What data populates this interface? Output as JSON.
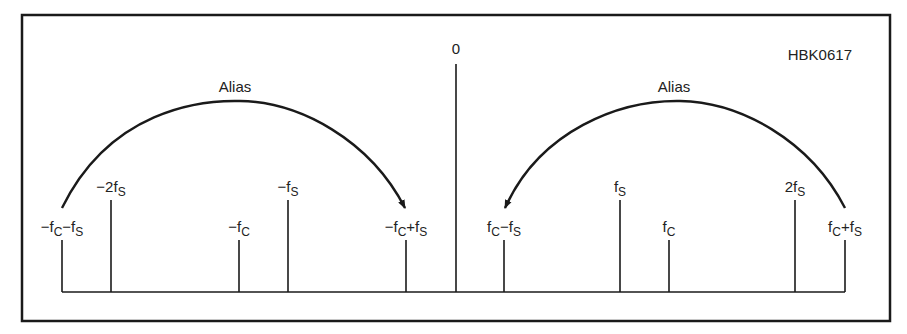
{
  "figure": {
    "id_label": "HBK0617",
    "zero_label": "0",
    "alias_left_label": "Alias",
    "alias_right_label": "Alias",
    "colors": {
      "ink": "#1a1a1a",
      "background": "#ffffff"
    }
  },
  "spectral_lines": [
    {
      "key": "neg_fc_minus_fs",
      "x": 62,
      "top": 240,
      "label_parts": [
        "−f",
        "C",
        "−f",
        "S"
      ]
    },
    {
      "key": "neg_2fs",
      "x": 111,
      "top": 200,
      "label_parts": [
        "−2f",
        "S"
      ]
    },
    {
      "key": "neg_fc",
      "x": 239,
      "top": 240,
      "label_parts": [
        "−f",
        "C"
      ]
    },
    {
      "key": "neg_fs",
      "x": 288,
      "top": 200,
      "label_parts": [
        "−f",
        "S"
      ]
    },
    {
      "key": "neg_fc_plus_fs",
      "x": 406,
      "top": 240,
      "label_parts": [
        "−f",
        "C",
        "+f",
        "S"
      ]
    },
    {
      "key": "zero",
      "x": 456,
      "top": 64,
      "label_parts": [
        "0"
      ]
    },
    {
      "key": "fc_minus_fs",
      "x": 504,
      "top": 240,
      "label_parts": [
        "f",
        "C",
        "−f",
        "S"
      ]
    },
    {
      "key": "fs",
      "x": 620,
      "top": 200,
      "label_parts": [
        "f",
        "S"
      ]
    },
    {
      "key": "fc",
      "x": 669,
      "top": 240,
      "label_parts": [
        "f",
        "C"
      ]
    },
    {
      "key": "2fs",
      "x": 795,
      "top": 200,
      "label_parts": [
        "2f",
        "S"
      ]
    },
    {
      "key": "fc_plus_fs",
      "x": 845,
      "top": 240,
      "label_parts": [
        "f",
        "C",
        "+f",
        "S"
      ]
    }
  ],
  "labels": {
    "neg_fc_minus_fs": {
      "a": "−f",
      "b": "C",
      "c": "−f",
      "d": "S"
    },
    "neg_2fs": {
      "a": "−2f",
      "b": "S"
    },
    "neg_fc": {
      "a": "−f",
      "b": "C"
    },
    "neg_fs": {
      "a": "−f",
      "b": "S"
    },
    "neg_fc_plus_fs": {
      "a": "−f",
      "b": "C",
      "c": "+f",
      "d": "S"
    },
    "fc_minus_fs": {
      "a": "f",
      "b": "C",
      "c": "−f",
      "d": "S"
    },
    "fs": {
      "a": "f",
      "b": "S"
    },
    "fc": {
      "a": "f",
      "b": "C"
    },
    "2fs": {
      "a": "2f",
      "b": "S"
    },
    "fc_plus_fs": {
      "a": "f",
      "b": "C",
      "c": "+f",
      "d": "S"
    }
  }
}
